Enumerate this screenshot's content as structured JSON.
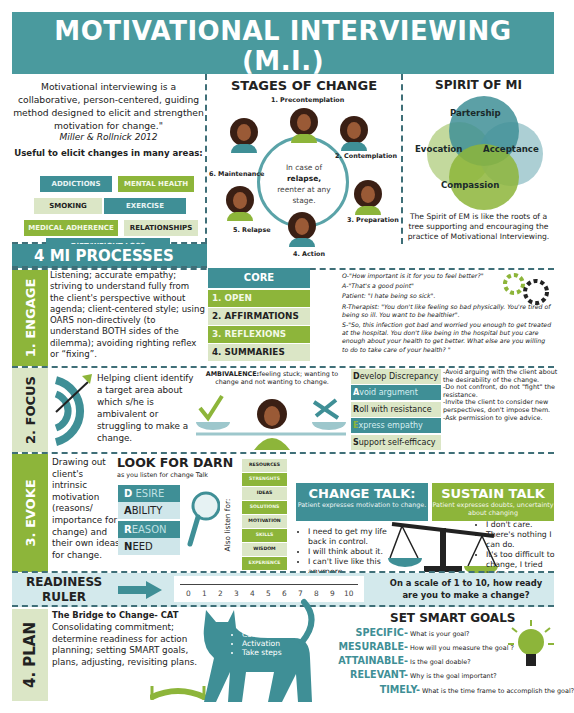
{
  "header": {
    "title": "MOTIVATIONAL INTERVIEWING (M.I.)",
    "subtitle": "Things do not change. We change.",
    "subtitle_author": "(Henry David Thoreau)",
    "credit": "Infographic by Manuel V. Vilugron, LCSW"
  },
  "colors": {
    "teal": "#3f8f96",
    "green": "#8db53a",
    "pale": "#dbe6c6",
    "light_teal": "#cfe6ea",
    "dark": "#222222"
  },
  "intro": {
    "quote": "Motivational interviewing is a collaborative, person-centered, guiding method designed to elicit and strengthen motivation for change.\"",
    "citation": "Miller & Rollnick  2012",
    "useful_label": "Useful to elicit changes in many areas:",
    "tags": [
      "ADDICTIONS",
      "MENTAL HEALTH",
      "SMOKING",
      "EXERCISE",
      "MEDICAL ADHERENCE",
      "RELATIONSHIPS",
      "DIET/WEIGHT LOSS"
    ]
  },
  "stages": {
    "title": "STAGES OF CHANGE",
    "items": [
      "1. Precontemplation",
      "2. Contemplation",
      "3. Preparation",
      "4. Action",
      "5. Relapse",
      "6. Maintenance"
    ],
    "note_1": "In case of",
    "note_bold": "relapse,",
    "note_2": "reenter at any stage."
  },
  "spirit": {
    "title": "SPIRIT OF MI",
    "labels": [
      "Partership",
      "Evocation",
      "Acceptance",
      "Compassion"
    ],
    "description": "The Spirit of EM is like the roots of a tree supporting and encouraging the practice of Motivational Interviewing."
  },
  "processes": {
    "title": "4 MI PROCESSES",
    "engage": {
      "label": "1. ENGAGE",
      "text": "Listening; accurate empathy; striving to understand fully from the client's perspective without agenda; client-centered style; using OARS non-directively (to understand BOTH sides of the dilemma); avoiding righting reflex or “fixing”.",
      "oars_title": "CORE SKILLS:OARS",
      "oars": [
        "1. OPEN QUESTIONS",
        "2. AFFIRMATIONS",
        "3. REFLEXIONS",
        "4. SUMMARIES"
      ],
      "examples": [
        "O-\"How important is it for you to feel better?\"",
        "A-\"That's a good point\"",
        "Patient: \"I hate being so sick\".",
        "R-Therapist: \"You don't like feeling so bad physically. You're tired of being so ill. You want to be healthier\".",
        "S-\"So, this infection got bad and worried you enough to get treated at the hospital. You don't like being in the hospital but you care enough about your health to get better. What else are you willing to do to take care of your health? \""
      ]
    },
    "focus": {
      "label": "2. FOCUS",
      "text": "Helping client identify a target area about which s/he is ambivalent or struggling to make a change.",
      "ambivalence_bold": "AMBIVALENCE:",
      "ambivalence_text": "feeling stuck; wanting to change and not wanting to change.",
      "dares": [
        {
          "letter": "D",
          "rest": "evelop Discrepancy"
        },
        {
          "letter": "A",
          "rest": "void argument"
        },
        {
          "letter": "R",
          "rest": "oll with resistance"
        },
        {
          "letter": "E",
          "rest": "xpress empathy"
        },
        {
          "letter": "S",
          "rest": "upport self-efficacy"
        }
      ],
      "notes": "-Avoid arguing with the client about the desirability of the change.\n-Do not confront, do not \"fight\" the resistance.\n-Invite the client to consider new perspectives, don't impose them.\n-Ask permission to give advice."
    },
    "evoke": {
      "label": "3. EVOKE",
      "text": "Drawing out client's intrinsic motivation (reasons/ importance for change) and their own ideas for change.",
      "darn_title": "LOOK FOR DARN",
      "darn_sub": "as you listen for change Talk",
      "darn": [
        {
          "letter": "D",
          "rest": " ESIRE"
        },
        {
          "letter": "A",
          "rest": "BILITY"
        },
        {
          "letter": "R",
          "rest": "EASON"
        },
        {
          "letter": "N",
          "rest": "EED"
        }
      ],
      "also_listen": "Also listen for:",
      "listen_tags": [
        "RESOURCES",
        "STRENGHTS",
        "IDEAS",
        "SOLUTIONS",
        "MOTIVATION",
        "SKILLS",
        "WISDOM",
        "EXPERIENCE"
      ],
      "change_talk": {
        "title": "CHANGE TALK:",
        "sub": "Patient expresses motivation to change.",
        "items": [
          "I need to get  my life back in  control.",
          "I will think  about it.",
          "I can't live like  this anymore."
        ]
      },
      "sustain_talk": {
        "title": "SUSTAIN TALK",
        "sub": "Patient expresses doubts, uncertainty about changing",
        "items": [
          "I don't  care.",
          "There's  nothing I can do.",
          "It's too difficult to change, I tried before."
        ]
      }
    },
    "ruler": {
      "title_1": "READINESS",
      "title_2": "RULER",
      "ticks": [
        "0",
        "1",
        "2",
        "3",
        "4",
        "5",
        "6",
        "7",
        "8",
        "9",
        "10"
      ],
      "question": "On a scale of 1 to 10, how ready are you to make  a change?"
    },
    "plan": {
      "label": "4. PLAN",
      "bridge_title": "The Bridge to Change- CAT",
      "text": "Consolidating commitment; determine readiness for action planning; setting SMART goals, plans, adjusting, revisiting plans.",
      "cat_title": "CAT",
      "cat_items": [
        "Commitment",
        "Activation",
        "Take steps"
      ],
      "smart_title": "SET SMART GOALS",
      "smart": [
        {
          "key": "SPECIFIC-",
          "q": "What is your goal?"
        },
        {
          "key": "MESURABLE-",
          "q": "How will you measure the goal ?"
        },
        {
          "key": "ATTAINABLE-",
          "q": "Is the goal doable?"
        },
        {
          "key": "RELEVANT-",
          "q": "Why is the goal important?"
        },
        {
          "key": "TIMELY-",
          "q": "What is the time frame to accomplish the goal?"
        }
      ]
    }
  }
}
